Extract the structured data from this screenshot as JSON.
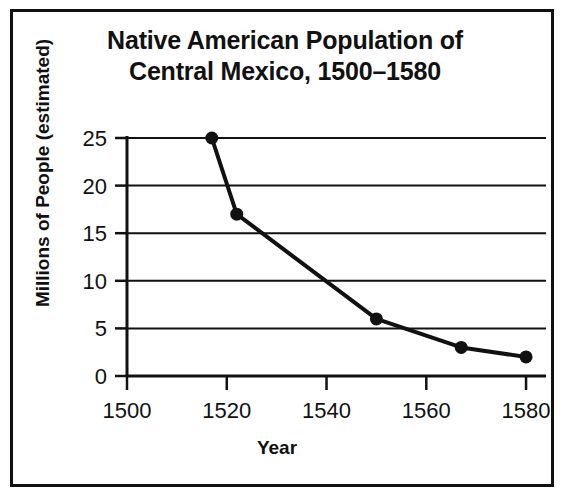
{
  "figure": {
    "title_line1": "Native American Population of",
    "title_line2": "Central Mexico, 1500–1580",
    "border_color": "#111111",
    "background": "#ffffff"
  },
  "chart_data": {
    "type": "line",
    "title": "Native American Population of Central Mexico, 1500–1580",
    "xlabel": "Year",
    "ylabel": "Millions of People (estimated)",
    "x": [
      1517,
      1522,
      1550,
      1567,
      1580
    ],
    "values": [
      25,
      17,
      6,
      3,
      2
    ],
    "series": [
      {
        "name": "Native American Population of Central Mexico",
        "points": [
          {
            "x": 1517,
            "y": 25
          },
          {
            "x": 1522,
            "y": 17
          },
          {
            "x": 1550,
            "y": 6
          },
          {
            "x": 1567,
            "y": 3
          },
          {
            "x": 1580,
            "y": 2
          }
        ]
      }
    ],
    "xlim": [
      1500,
      1584
    ],
    "ylim": [
      0,
      25
    ],
    "x_ticks": [
      1500,
      1520,
      1540,
      1560,
      1580
    ],
    "x_tick_labels": [
      "1500",
      "1520",
      "1540",
      "1560",
      "1580"
    ],
    "y_ticks": [
      0,
      5,
      10,
      15,
      20,
      25
    ],
    "y_tick_labels": [
      "0",
      "5",
      "10",
      "15",
      "20",
      "25"
    ],
    "grid": "horizontal",
    "legend": "none",
    "marker": "filled-circle",
    "line_color": "#111111",
    "marker_color": "#111111"
  }
}
